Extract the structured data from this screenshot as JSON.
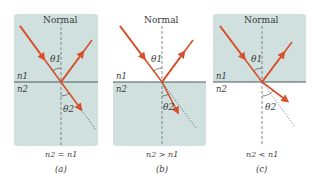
{
  "colors": {
    "medium_fill": "#cfe0df",
    "interface_line": "#4a5a5a",
    "ray": "#d8502c",
    "normal_line": "#6a7070",
    "dotted_a_b": "#404848",
    "dotted_c": "#4a6ab0",
    "arc": "#3a3a3a"
  },
  "panels": [
    {
      "id": "a",
      "normal_label": "Normal",
      "n1_label": "n1",
      "n2_label": "n2",
      "theta1_label": "θ1",
      "theta2_label": "θ2",
      "relation": "n2 = n1",
      "caption": "(a)"
    },
    {
      "id": "b",
      "normal_label": "Normal",
      "n1_label": "n1",
      "n2_label": "n2",
      "theta1_label": "θ1",
      "theta2_label": "θ2",
      "relation": "n2 > n1",
      "caption": "(b)"
    },
    {
      "id": "c",
      "normal_label": "Normal",
      "n1_label": "n1",
      "n2_label": "n2",
      "theta1_label": "θ1",
      "theta2_label": "θ2",
      "relation": "n2 < n1",
      "caption": "(c)"
    }
  ]
}
